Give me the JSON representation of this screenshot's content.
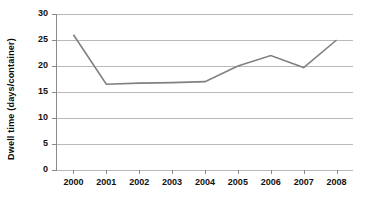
{
  "chart_data": {
    "type": "line",
    "title": "",
    "xlabel": "",
    "ylabel": "Dwell time (days/container)",
    "categories": [
      "2000",
      "2001",
      "2002",
      "2003",
      "2004",
      "2005",
      "2006",
      "2007",
      "2008"
    ],
    "values": [
      26,
      16.5,
      16.7,
      16.8,
      17,
      20,
      22,
      19.7,
      25
    ],
    "series": [
      {
        "name": "Dwell time",
        "values": [
          26,
          16.5,
          16.7,
          16.8,
          17,
          20,
          22,
          19.7,
          25
        ],
        "color": "#808080"
      }
    ],
    "ylim": [
      0,
      30
    ],
    "y_ticks": [
      0,
      5,
      10,
      15,
      20,
      25,
      30
    ],
    "y_tick_labels": [
      "0",
      "5",
      "10",
      "15",
      "20",
      "25",
      "30"
    ],
    "x_tick_labels": [
      "2000",
      "2001",
      "2002",
      "2003",
      "2004",
      "2005",
      "2006",
      "2007",
      "2008"
    ],
    "grid": true,
    "grid_axis": "y",
    "legend": false,
    "legend_position": "none",
    "markers": false,
    "colors": {
      "line": "#808080",
      "gridline": "#b9b9b9",
      "axis": "#8a8a8a",
      "text": "#111111",
      "background": "#ffffff"
    }
  }
}
